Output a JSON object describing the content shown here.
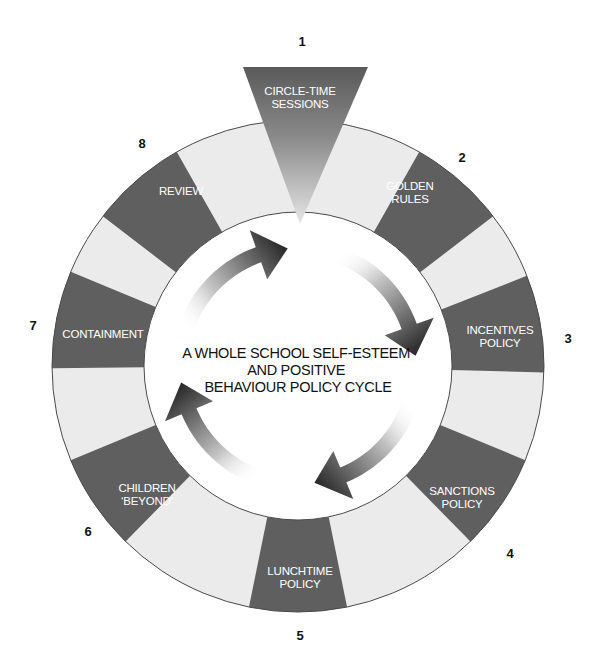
{
  "title": {
    "lines": [
      "A WHOLE SCHOOL SELF-ESTEEM",
      "AND POSITIVE",
      "BEHAVIOUR POLICY CYCLE"
    ]
  },
  "colors": {
    "dark_segment": "#5f5f5f",
    "light_segment": "#ebebeb",
    "outline": "#4a4a4a",
    "label_text": "#ffffff",
    "number_text": "#111111"
  },
  "steps": [
    {
      "number": "1",
      "lines": [
        "CIRCLE-TIME",
        "SESSIONS"
      ]
    },
    {
      "number": "2",
      "lines": [
        "GOLDEN",
        "RULES"
      ]
    },
    {
      "number": "3",
      "lines": [
        "INCENTIVES",
        "POLICY"
      ]
    },
    {
      "number": "4",
      "lines": [
        "SANCTIONS",
        "POLICY"
      ]
    },
    {
      "number": "5",
      "lines": [
        "LUNCHTIME",
        "POLICY"
      ]
    },
    {
      "number": "6",
      "lines": [
        "CHILDREN",
        "‘BEYOND’"
      ]
    },
    {
      "number": "7",
      "lines": [
        "CONTAINMENT"
      ]
    },
    {
      "number": "8",
      "lines": [
        "REVIEW"
      ]
    }
  ],
  "arrows": {
    "count": 4,
    "direction": "clockwise"
  }
}
